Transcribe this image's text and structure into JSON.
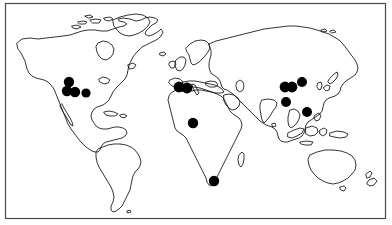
{
  "figure": {
    "type": "world-distribution-map",
    "title": "World map with filled circular locality markers",
    "caption": "",
    "projection": "equirectangular",
    "frame": {
      "border_color": "#4a4a4a",
      "border_width_px": 1,
      "x": 5,
      "y": 3,
      "width": 381,
      "height": 216
    },
    "colors": {
      "background": "#ffffff",
      "coastline": "#111111",
      "marker_fill": "#000000",
      "frame": "#4a4a4a"
    },
    "marker_style": {
      "shape": "filled-circle",
      "default_radius_px": 5
    }
  },
  "legend": {
    "visible": false,
    "entries": []
  },
  "axes": {
    "visible": false,
    "x_ticks": [],
    "y_ticks": []
  },
  "chart_data": {
    "type": "scatter",
    "title": "World map with filled circular locality markers",
    "xlabel": "",
    "ylabel": "",
    "xlim": [
      5,
      386
    ],
    "ylim": [
      3,
      219
    ],
    "grid": false,
    "legend_position": "none",
    "series": [
      {
        "name": "localities",
        "marker": "filled-circle",
        "color": "#000000",
        "points": [
          {
            "region": "north-america-northwest",
            "x": 69,
            "y": 82,
            "r": 5.2
          },
          {
            "region": "north-america-southwest",
            "x": 67,
            "y": 91,
            "r": 5.2
          },
          {
            "region": "north-america-south-central",
            "x": 75,
            "y": 92,
            "r": 5.2
          },
          {
            "region": "north-america-central",
            "x": 86,
            "y": 93,
            "r": 4.6
          },
          {
            "region": "mediterranean-west",
            "x": 179,
            "y": 87,
            "r": 5.4
          },
          {
            "region": "north-africa-northeast",
            "x": 187,
            "y": 88,
            "r": 5.4
          },
          {
            "region": "west-africa",
            "x": 193,
            "y": 123,
            "r": 5.2
          },
          {
            "region": "southern-africa",
            "x": 214,
            "y": 181,
            "r": 5.2
          },
          {
            "region": "central-asia-west",
            "x": 285,
            "y": 87,
            "r": 5.4
          },
          {
            "region": "central-asia-east",
            "x": 292,
            "y": 87,
            "r": 5.4
          },
          {
            "region": "northeast-asia",
            "x": 302,
            "y": 82,
            "r": 5.0
          },
          {
            "region": "south-central-asia",
            "x": 286,
            "y": 102,
            "r": 5.0
          },
          {
            "region": "east-asia-southeast",
            "x": 307,
            "y": 112,
            "r": 5.0
          }
        ]
      }
    ]
  },
  "annotations": {
    "dot_count_label": "13",
    "regions_covered": [
      "North America",
      "Mediterranean / North Africa",
      "West Africa",
      "Southern Africa",
      "Central Asia",
      "East Asia"
    ]
  }
}
